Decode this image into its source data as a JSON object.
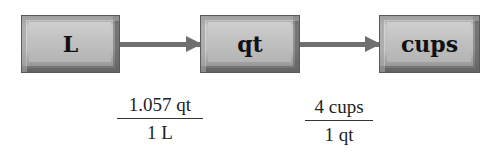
{
  "diagram": {
    "nodes": [
      {
        "id": "L",
        "label": "L"
      },
      {
        "id": "qt",
        "label": "qt"
      },
      {
        "id": "cups",
        "label": "cups"
      }
    ],
    "edges": [
      {
        "from": "L",
        "to": "qt"
      },
      {
        "from": "qt",
        "to": "cups"
      }
    ],
    "conversion_factors": [
      {
        "numerator": "1.057 qt",
        "denominator": "1 L"
      },
      {
        "numerator": "4 cups",
        "denominator": "1 qt"
      }
    ]
  }
}
